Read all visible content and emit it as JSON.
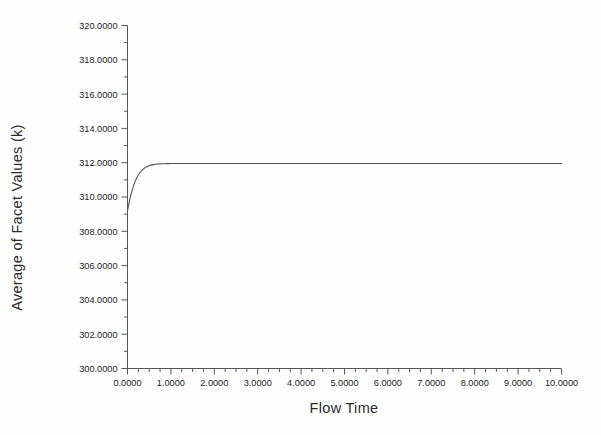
{
  "chart_data": {
    "type": "line",
    "title": "",
    "xlabel": "Flow Time",
    "ylabel": "Average of Facet Values (k)",
    "xlim": [
      0,
      10
    ],
    "ylim": [
      300,
      320
    ],
    "grid": false,
    "legend": null,
    "line_color": "#555555",
    "background_color": "#fefefe",
    "axis_color": "#555555",
    "x_tick_labels": [
      "0.0000",
      "1.0000",
      "2.0000",
      "3.0000",
      "4.0000",
      "5.0000",
      "6.0000",
      "7.0000",
      "8.0000",
      "9.0000",
      "10.0000"
    ],
    "x_tick_values": [
      0,
      1,
      2,
      3,
      4,
      5,
      6,
      7,
      8,
      9,
      10
    ],
    "x_minor_per_major": 4,
    "y_tick_labels": [
      "320.0000",
      "318.0000",
      "316.0000",
      "314.0000",
      "312.0000",
      "310.0000",
      "308.0000",
      "306.0000",
      "304.0000",
      "302.0000",
      "300.0000"
    ],
    "y_tick_values": [
      320,
      318,
      316,
      314,
      312,
      310,
      308,
      306,
      304,
      302,
      300
    ],
    "y_minor_per_major": 2,
    "series": [
      {
        "name": "Average of Facet Values (k)",
        "x": [
          0.0,
          0.02,
          0.05,
          0.08,
          0.11,
          0.14,
          0.17,
          0.2,
          0.24,
          0.28,
          0.32,
          0.36,
          0.4,
          0.45,
          0.5,
          0.55,
          0.6,
          0.65,
          0.7,
          0.75,
          0.8,
          0.85,
          0.9,
          0.95,
          1.0,
          1.1,
          1.2,
          1.3,
          1.5,
          1.75,
          2.0,
          2.5,
          3.0,
          3.5,
          4.0,
          4.5,
          5.0,
          5.5,
          6.0,
          6.5,
          7.0,
          7.5,
          8.0,
          8.5,
          9.0,
          9.5,
          10.0
        ],
        "y": [
          309.2,
          309.45,
          309.82,
          310.14,
          310.42,
          310.66,
          310.87,
          311.05,
          311.24,
          311.4,
          311.52,
          311.62,
          311.7,
          311.77,
          311.83,
          311.86,
          311.89,
          311.91,
          311.92,
          311.93,
          311.935,
          311.94,
          311.945,
          311.948,
          311.95,
          311.95,
          311.95,
          311.95,
          311.95,
          311.95,
          311.95,
          311.95,
          311.95,
          311.95,
          311.95,
          311.95,
          311.95,
          311.95,
          311.95,
          311.95,
          311.95,
          311.95,
          311.95,
          311.95,
          311.95,
          311.95,
          311.95
        ]
      }
    ]
  }
}
